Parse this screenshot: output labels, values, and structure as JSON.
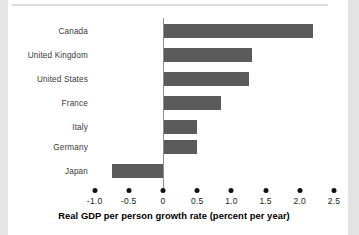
{
  "chart_data": {
    "type": "bar",
    "orientation": "horizontal",
    "title": "",
    "xlabel": "Real GDP per person growth rate (percent per year)",
    "ylabel": "",
    "categories": [
      "Canada",
      "United Kingdom",
      "United States",
      "France",
      "Italy",
      "Germany",
      "Japan"
    ],
    "values": [
      2.2,
      1.3,
      1.25,
      0.85,
      0.5,
      0.5,
      -0.75
    ],
    "xlim": [
      -1.0,
      2.5
    ],
    "xticks": [
      -1.0,
      -0.5,
      0,
      0.5,
      1.0,
      1.5,
      2.0,
      2.5
    ],
    "xtick_labels": [
      "-1.0",
      "-0.5",
      "0",
      "0.5",
      "1.0",
      "1.5",
      "2.0",
      "2.5"
    ],
    "grid": false,
    "legend": null,
    "bar_color": "#5b5b5b",
    "axis_color": "#8d8d8d",
    "tick_marker": "round-dot"
  },
  "figure": {
    "background": "#ffffff",
    "top_rule_color": "#dcdcdc",
    "edge_shade_color": "#e6e6e6"
  }
}
